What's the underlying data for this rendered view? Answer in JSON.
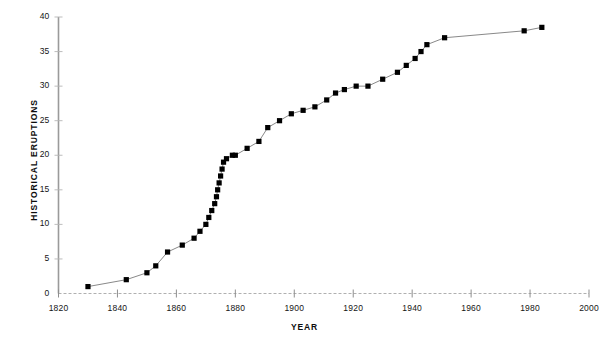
{
  "chart_data": {
    "type": "line",
    "title": "",
    "xlabel": "YEAR",
    "ylabel": "HISTORICAL ERUPTIONS",
    "xlim": [
      1820,
      2000
    ],
    "ylim": [
      0,
      40
    ],
    "xticks": [
      1820,
      1840,
      1860,
      1880,
      1900,
      1920,
      1940,
      1960,
      1980,
      2000
    ],
    "yticks": [
      0,
      5,
      10,
      15,
      20,
      25,
      30,
      35,
      40
    ],
    "grid": false,
    "legend": "none",
    "marker": "square",
    "marker_color": "#000000",
    "line_color": "#666666",
    "axis_color": "#999999",
    "x": [
      1830,
      1843,
      1850,
      1853,
      1857,
      1862,
      1866,
      1868,
      1870,
      1871,
      1872,
      1873,
      1873.6,
      1874,
      1874.5,
      1875,
      1875.5,
      1876,
      1877,
      1879,
      1880,
      1884,
      1888,
      1891,
      1895,
      1899,
      1903,
      1907,
      1911,
      1914,
      1917,
      1921,
      1925,
      1930,
      1935,
      1938,
      1941,
      1943,
      1945,
      1951,
      1978,
      1984
    ],
    "y": [
      1,
      2,
      3,
      4,
      6,
      7,
      8,
      9,
      10,
      11,
      12,
      13,
      14,
      15,
      16,
      17,
      18,
      19,
      19.5,
      20,
      20,
      21,
      22,
      24,
      25,
      26,
      26.5,
      27,
      28,
      29,
      29.5,
      30,
      30,
      31,
      32,
      33,
      34,
      35,
      36,
      37,
      38,
      38.5
    ],
    "ylabel_ticklabels": [
      "0",
      "5",
      "10",
      "15",
      "20",
      "25",
      "30",
      "35",
      "40"
    ],
    "xlabel_ticklabels": [
      "1820",
      "1840",
      "1860",
      "1880",
      "1900",
      "1920",
      "1940",
      "1960",
      "1980",
      "2000"
    ]
  }
}
